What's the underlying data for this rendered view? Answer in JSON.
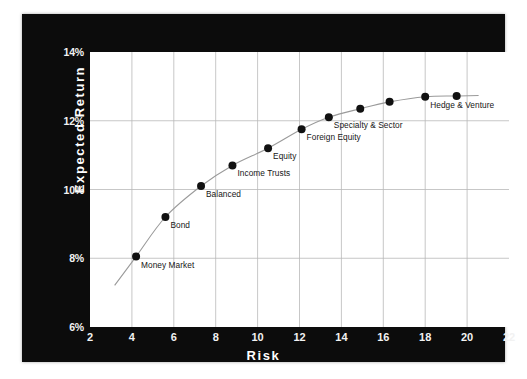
{
  "chart_data": {
    "type": "scatter",
    "title": "",
    "xlabel": "Risk",
    "ylabel": "Expected Return",
    "xlim": [
      2,
      22
    ],
    "ylim": [
      6,
      14
    ],
    "xticks": [
      "2",
      "4",
      "6",
      "8",
      "10",
      "12",
      "14",
      "16",
      "18",
      "20",
      "22"
    ],
    "yticks": [
      "6%",
      "8%",
      "10%",
      "12%",
      "14%"
    ],
    "grid": true,
    "legend": "none",
    "points": [
      {
        "label": "Money Market",
        "x": 4.2,
        "y": 8.05
      },
      {
        "label": "Bond",
        "x": 5.6,
        "y": 9.2
      },
      {
        "label": "Balanced",
        "x": 7.3,
        "y": 10.1
      },
      {
        "label": "Income Trusts",
        "x": 8.8,
        "y": 10.7
      },
      {
        "label": "Equity",
        "x": 10.5,
        "y": 11.2
      },
      {
        "label": "Foreign Equity",
        "x": 12.1,
        "y": 11.75
      },
      {
        "label": "Specialty & Sector",
        "x": 13.4,
        "y": 12.1
      },
      {
        "label": "",
        "x": 14.9,
        "y": 12.35
      },
      {
        "label": "",
        "x": 16.3,
        "y": 12.55
      },
      {
        "label": "Hedge & Venture",
        "x": 18.0,
        "y": 12.7
      },
      {
        "label": "",
        "x": 19.5,
        "y": 12.72
      }
    ],
    "curve_extends_before": true,
    "curve_extends_after": true,
    "colors": {
      "frame": "#0c0c0c",
      "plot_background": "#ffffff",
      "grid": "#b9b9b9",
      "marker": "#111111",
      "curve": "#9a9a9a",
      "tick_text": "#f2f2f2",
      "axis_title": "#ffffff",
      "point_label": "#161616"
    }
  }
}
